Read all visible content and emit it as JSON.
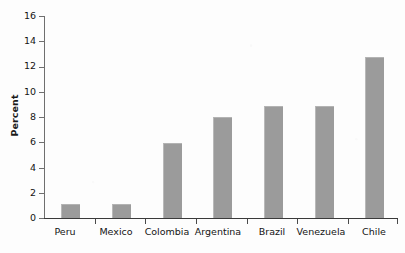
{
  "chart_data": {
    "type": "bar",
    "title": "",
    "subtitle": "",
    "xlabel": "",
    "ylabel": "Percent",
    "categories": [
      "Peru",
      "Mexico",
      "Colombia",
      "Argentina",
      "Brazil",
      "Venezuela",
      "Chile"
    ],
    "values": [
      1.0,
      1.0,
      5.9,
      7.9,
      8.8,
      8.8,
      12.7
    ],
    "ylim": [
      0,
      16
    ],
    "ytick_labels": [
      "0",
      "2",
      "4",
      "6",
      "8",
      "10",
      "12",
      "14",
      "16"
    ],
    "ytick_values": [
      0,
      2,
      4,
      6,
      8,
      10,
      12,
      14,
      16
    ],
    "grid": false,
    "legend": false,
    "legend_position": "none",
    "bar_color": "#9b9b9b",
    "axis_color": "#3a3a3a",
    "background_color": "#fdfdfd",
    "series": [
      {
        "name": "Percent",
        "values": [
          1.0,
          1.0,
          5.9,
          7.9,
          8.8,
          8.8,
          12.7
        ]
      }
    ]
  }
}
